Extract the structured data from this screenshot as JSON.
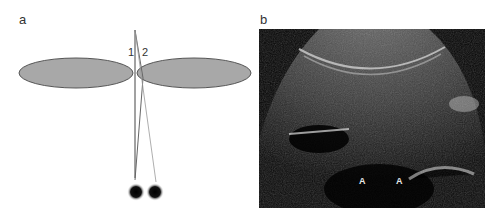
{
  "figure": {
    "panels": [
      {
        "label": "a",
        "type": "diagram",
        "beam_labels": [
          "1",
          "2"
        ],
        "description": "Two gray ellipses (lobes) side by side with two converging beams from a transducer point; beam 1 passes through gap, beam 2 crosses right lobe edge, producing two dark dot targets below"
      },
      {
        "label": "b",
        "type": "ultrasound-image",
        "markers": [
          "A",
          "A"
        ]
      }
    ],
    "colors": {
      "ellipse_fill": "#a8a8a8",
      "ellipse_stroke": "#555555",
      "beam_line": "#444444",
      "beam_line_2": "#888888",
      "target": "#111111",
      "ultrasound_bg": "#050505"
    }
  }
}
